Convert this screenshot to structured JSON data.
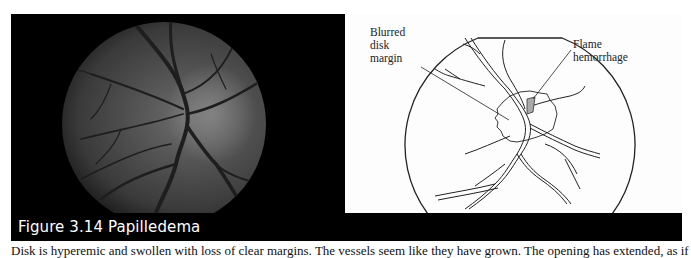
{
  "figure": {
    "number": "Figure 3.14",
    "title": "Papilledema",
    "caption": "Figure 3.14  Papilledema",
    "photo": {
      "description": "Fundus photograph of optic disk with papilledema"
    },
    "diagram": {
      "labels": [
        {
          "id": "blurred-disk-margin",
          "text": "Blurred\ndisk\nmargin"
        },
        {
          "id": "flame-hemorrhage",
          "text": "Flame\nhemorrhage"
        }
      ]
    },
    "colors": {
      "frame": "#000000",
      "caption_text": "#ffffff",
      "diagram_bg": "#fdfdfd",
      "line": "#222222"
    }
  },
  "body": {
    "text": "Disk is hyperemic and swollen with loss of clear margins. The vessels seem like they have grown. The opening has extended, as if dissolved."
  }
}
